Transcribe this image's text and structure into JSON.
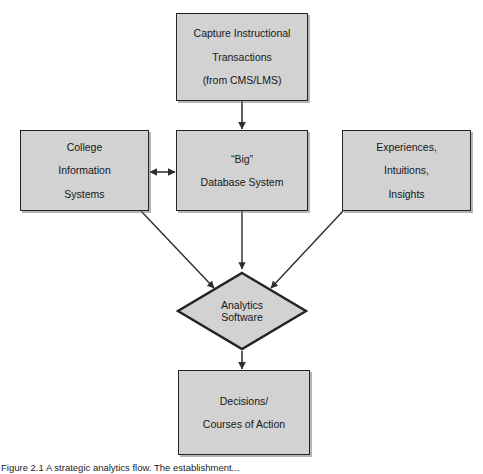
{
  "figure": {
    "caption": "Figure 2.1 A strategic analytics flow. The establishment..."
  },
  "colors": {
    "shape_fill": "#d2d2d2",
    "shape_stroke": "#222426",
    "connector": "#2b2d2f",
    "text": "#16181a",
    "background": "#ffffff"
  },
  "nodes": {
    "capture": {
      "shape": "rectangle",
      "lines": [
        "Capture Instructional",
        "Transactions",
        "(from CMS/LMS)"
      ],
      "line1": "Capture Instructional",
      "line2": "Transactions",
      "line3": "(from CMS/LMS)"
    },
    "college": {
      "shape": "rectangle",
      "lines": [
        "College",
        "Information",
        "Systems"
      ],
      "line1": "College",
      "line2": "Information",
      "line3": "Systems"
    },
    "database": {
      "shape": "rectangle",
      "lines": [
        "“Big”",
        "Database System"
      ],
      "line1": "“Big”",
      "line2": "Database System"
    },
    "experiences": {
      "shape": "rectangle",
      "lines": [
        "Experiences,",
        "Intuitions,",
        "Insights"
      ],
      "line1": "Experiences,",
      "line2": "Intuitions,",
      "line3": "Insights"
    },
    "analytics": {
      "shape": "diamond",
      "lines": [
        "Analytics",
        "Software"
      ],
      "line1": "Analytics",
      "line2": "Software"
    },
    "decisions": {
      "shape": "rectangle",
      "lines": [
        "Decisions/",
        "Courses of Action"
      ],
      "line1": "Decisions/",
      "line2": "Courses of Action"
    }
  },
  "connectors": [
    {
      "name": "capture-to-database",
      "from": "capture",
      "to": "database",
      "style": "single-arrow",
      "direction": "down"
    },
    {
      "name": "college-to-database",
      "from": "college",
      "to": "database",
      "style": "double-arrow",
      "direction": "horizontal"
    },
    {
      "name": "college-to-analytics",
      "from": "college",
      "to": "analytics",
      "style": "single-arrow",
      "direction": "diagonal-down-right"
    },
    {
      "name": "database-to-analytics",
      "from": "database",
      "to": "analytics",
      "style": "single-arrow",
      "direction": "down"
    },
    {
      "name": "experiences-to-analytics",
      "from": "experiences",
      "to": "analytics",
      "style": "single-arrow",
      "direction": "diagonal-down-left"
    },
    {
      "name": "analytics-to-decisions",
      "from": "analytics",
      "to": "decisions",
      "style": "single-arrow",
      "direction": "down"
    }
  ]
}
